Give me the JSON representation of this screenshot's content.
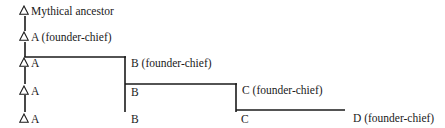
{
  "diagram": {
    "type": "segmentary-lineage",
    "line_color": "#1a1a1a",
    "nodes": {
      "mythical": {
        "symbol": "triangle-icon",
        "label": "Mythical ancestor"
      },
      "a_founder": {
        "symbol": "triangle-icon",
        "label": "A (founder-chief)"
      },
      "a_gen3": {
        "symbol": "triangle-icon",
        "label": "A"
      },
      "a_gen4": {
        "symbol": "triangle-icon",
        "label": "A"
      },
      "a_gen5": {
        "symbol": "triangle-icon",
        "label": "A"
      },
      "b_founder": {
        "label": "B (founder-chief)"
      },
      "b_gen4": {
        "label": "B"
      },
      "b_gen5": {
        "label": "B"
      },
      "c_founder": {
        "label": "C (founder-chief)"
      },
      "c_gen5": {
        "label": "C"
      },
      "d_founder": {
        "label": "D (founder-chief)"
      }
    },
    "generations": [
      [
        "Mythical ancestor"
      ],
      [
        "A (founder-chief)"
      ],
      [
        "A",
        "B (founder-chief)"
      ],
      [
        "A",
        "B",
        "C (founder-chief)"
      ],
      [
        "A",
        "B",
        "C",
        "D (founder-chief)"
      ]
    ]
  }
}
